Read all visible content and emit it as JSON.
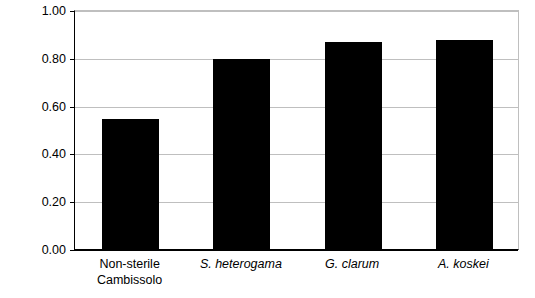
{
  "chart_data": {
    "type": "bar",
    "title": "",
    "xlabel": "",
    "ylabel": "Kg C/tree",
    "ylim": [
      0.0,
      1.0
    ],
    "ytick_step": 0.2,
    "ytick_labels": [
      "1.00",
      "0.80",
      "0.60",
      "0.40",
      "0.20",
      "0.00"
    ],
    "ytick_values": [
      1.0,
      0.8,
      0.6,
      0.4,
      0.2,
      0.0
    ],
    "grid": true,
    "legend": "none",
    "bar_color": "#000000",
    "categories": [
      "Non-sterile Cambissolo",
      "S. heterogama",
      "G. clarum",
      "A. koskei"
    ],
    "category_lines": [
      [
        "Non-sterile",
        "Cambissolo"
      ],
      [
        "S. heterogama"
      ],
      [
        "G. clarum"
      ],
      [
        "A. koskei"
      ]
    ],
    "category_italic": [
      false,
      true,
      true,
      true
    ],
    "values": [
      0.545,
      0.795,
      0.865,
      0.875
    ]
  }
}
